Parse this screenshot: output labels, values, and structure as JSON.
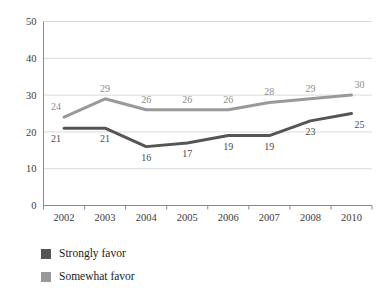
{
  "chart_data": {
    "type": "line",
    "title": "",
    "subtitle": "",
    "xlabel": "",
    "ylabel": "",
    "categories": [
      "2002",
      "2003",
      "2004",
      "2005",
      "2006",
      "2007",
      "2008",
      "2010"
    ],
    "series": [
      {
        "name": "Strongly favor",
        "color": "#555555",
        "values": [
          21,
          21,
          16,
          17,
          19,
          19,
          23,
          25
        ],
        "label_position": "below"
      },
      {
        "name": "Somewhat favor",
        "color": "#999999",
        "values": [
          24,
          29,
          26,
          26,
          26,
          28,
          29,
          30
        ],
        "label_position": "above"
      }
    ],
    "ylim": [
      0,
      50
    ],
    "yticks": [
      0,
      10,
      20,
      30,
      40,
      50
    ],
    "ytick_labels": [
      "0",
      "10",
      "20",
      "30",
      "40",
      "50"
    ],
    "grid": true,
    "grid_axis": "y",
    "grid_color": "#d9d9d9",
    "axis_color": "#8a8a8a",
    "background": "#ffffff",
    "legend_position": "bottom-left",
    "legend": [
      {
        "label": "Strongly favor",
        "color": "#555555"
      },
      {
        "label": "Somewhat favor",
        "color": "#999999"
      }
    ]
  }
}
